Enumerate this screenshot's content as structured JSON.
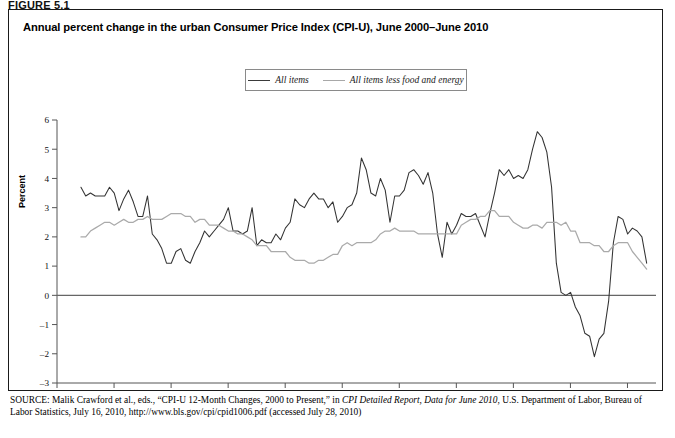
{
  "figure": {
    "label": "FIGURE 5.1",
    "title": "Annual percent change in the urban Consumer Price Index (CPI-U), June 2000–June 2010"
  },
  "source": {
    "prefix": "SOURCE:",
    "line1_a": " Malik Crawford et al., eds., “CPI-U 12-Month Changes, 2000 to Present,” in ",
    "line1_italic": "CPI Detailed Report, Data for June 2010",
    "line1_b": ", U.S. Department of",
    "line2": "Labor, Bureau of Labor Statistics, July 16, 2010, http://www.bls.gov/cpi/cpid1006.pdf (accessed July 28, 2010)"
  },
  "legend": {
    "position": "top-center",
    "items": [
      {
        "label": "All items",
        "color": "#333333"
      },
      {
        "label": "All items less food and energy",
        "color": "#aaaaaa"
      }
    ]
  },
  "chart_data": {
    "type": "line",
    "title": "Annual percent change in the urban Consumer Price Index (CPI-U), June 2000–June 2010",
    "xlabel": "",
    "ylabel": "Percent",
    "ylim": [
      -3,
      6
    ],
    "xlim": [
      2000.0,
      2010.5
    ],
    "yticks": [
      -3,
      -2,
      -1,
      0,
      1,
      2,
      3,
      4,
      5,
      6
    ],
    "xticks": [
      2000,
      2001,
      2002,
      2003,
      2004,
      2005,
      2006,
      2007,
      2008,
      2009,
      2010
    ],
    "grid": false,
    "zero_line": true,
    "x_start": 2000.42,
    "x_step": 0.08333,
    "series": [
      {
        "name": "All items",
        "color": "#333333",
        "values": [
          3.7,
          3.4,
          3.5,
          3.4,
          3.4,
          3.4,
          3.7,
          3.5,
          2.9,
          3.3,
          3.6,
          3.2,
          2.7,
          2.7,
          3.4,
          2.1,
          1.9,
          1.6,
          1.1,
          1.1,
          1.5,
          1.6,
          1.2,
          1.1,
          1.5,
          1.8,
          2.2,
          2.0,
          2.2,
          2.4,
          2.6,
          3.0,
          2.2,
          2.2,
          2.1,
          2.2,
          3.0,
          1.7,
          1.9,
          1.8,
          1.8,
          2.1,
          1.9,
          2.3,
          2.5,
          3.3,
          3.1,
          3.0,
          3.3,
          3.5,
          3.3,
          3.3,
          3.0,
          3.2,
          2.5,
          2.7,
          3.0,
          3.1,
          3.5,
          4.7,
          4.3,
          3.5,
          3.4,
          4.0,
          3.6,
          2.5,
          3.4,
          3.4,
          3.6,
          4.2,
          4.3,
          4.1,
          3.8,
          4.2,
          3.5,
          2.1,
          1.3,
          2.5,
          2.1,
          2.4,
          2.8,
          2.7,
          2.7,
          2.8,
          2.4,
          2.0,
          2.8,
          3.5,
          4.3,
          4.1,
          4.3,
          4.0,
          4.1,
          4.0,
          4.3,
          5.0,
          5.6,
          5.4,
          4.9,
          3.7,
          1.1,
          0.1,
          0.0,
          0.1,
          -0.4,
          -0.7,
          -1.3,
          -1.4,
          -2.1,
          -1.5,
          -1.3,
          -0.2,
          1.8,
          2.7,
          2.6,
          2.1,
          2.3,
          2.2,
          2.0,
          1.1
        ]
      },
      {
        "name": "All items less food and energy",
        "color": "#aaaaaa",
        "values": [
          2.0,
          2.0,
          2.2,
          2.3,
          2.4,
          2.5,
          2.5,
          2.4,
          2.5,
          2.6,
          2.5,
          2.5,
          2.6,
          2.6,
          2.7,
          2.6,
          2.6,
          2.6,
          2.7,
          2.8,
          2.8,
          2.8,
          2.7,
          2.7,
          2.5,
          2.6,
          2.6,
          2.4,
          2.4,
          2.4,
          2.3,
          2.2,
          2.2,
          2.1,
          2.1,
          2.0,
          1.9,
          1.7,
          1.7,
          1.7,
          1.5,
          1.5,
          1.5,
          1.5,
          1.3,
          1.2,
          1.2,
          1.2,
          1.1,
          1.1,
          1.2,
          1.2,
          1.3,
          1.4,
          1.4,
          1.7,
          1.8,
          1.7,
          1.8,
          1.8,
          1.8,
          1.8,
          1.9,
          2.1,
          2.2,
          2.2,
          2.3,
          2.2,
          2.2,
          2.2,
          2.2,
          2.1,
          2.1,
          2.1,
          2.1,
          2.1,
          2.1,
          2.1,
          2.1,
          2.1,
          2.4,
          2.5,
          2.6,
          2.6,
          2.7,
          2.7,
          2.9,
          2.9,
          2.7,
          2.7,
          2.7,
          2.5,
          2.4,
          2.3,
          2.3,
          2.4,
          2.4,
          2.3,
          2.5,
          2.5,
          2.5,
          2.4,
          2.5,
          2.2,
          2.2,
          1.8,
          1.8,
          1.8,
          1.7,
          1.7,
          1.5,
          1.5,
          1.7,
          1.8,
          1.8,
          1.8,
          1.5,
          1.3,
          1.1,
          0.9
        ]
      }
    ]
  }
}
